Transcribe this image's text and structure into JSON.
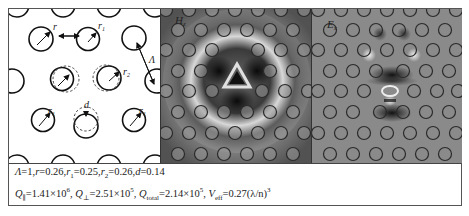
{
  "figure": {
    "panels": [
      {
        "id": "schematic",
        "labels": {
          "r": "r",
          "r1": "r",
          "r1_sub": "1",
          "r2": "r",
          "r2_sub": "2",
          "lattice_const": "Λ",
          "shift": "d"
        }
      },
      {
        "id": "hz-field",
        "label": "H",
        "label_sub": "z"
      },
      {
        "id": "ex-field",
        "label": "E",
        "label_sub": "x"
      }
    ],
    "caption": {
      "line1": {
        "lambda_sym": "Λ",
        "lambda_val": "=1,",
        "r_sym": "r",
        "r_val": "=0.26,",
        "r1_sym": "r",
        "r1_sub": "1",
        "r1_val": "=0.25,",
        "r2_sym": "r",
        "r2_sub": "2",
        "r2_val": "=0.26,",
        "d_sym": "d",
        "d_val": "=0.14"
      },
      "line2": {
        "q_par_sym": "Q",
        "q_par_sub": "∥",
        "q_par_val": "=1.41×10",
        "q_par_exp": "6",
        "sep1": ",  ",
        "q_perp_sym": "Q",
        "q_perp_sub": "⊥",
        "q_perp_val": "=2.51×10",
        "q_perp_exp": "5",
        "sep2": ",  ",
        "q_total_sym": "Q",
        "q_total_sub": "total",
        "q_total_val": "=2.14×10",
        "q_total_exp": "5",
        "sep3": ",  ",
        "v_sym": "V",
        "v_sub": "eff",
        "v_val": "=0.27(λ/n)",
        "v_exp": "3"
      }
    }
  }
}
